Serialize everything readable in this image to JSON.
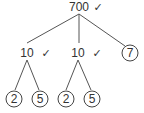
{
  "diagram": {
    "type": "factor-tree",
    "colors": {
      "stroke": "#555555",
      "text": "#333333",
      "background": "#ffffff"
    },
    "check_glyph": "✓",
    "nodes": {
      "root": {
        "value": "700",
        "checked": true
      },
      "left": {
        "value": "10",
        "checked": true
      },
      "middle": {
        "value": "10",
        "checked": true
      },
      "right": {
        "value": "7",
        "circled": true
      },
      "left_a": {
        "value": "2",
        "circled": true
      },
      "left_b": {
        "value": "5",
        "circled": true
      },
      "middle_a": {
        "value": "2",
        "circled": true
      },
      "middle_b": {
        "value": "5",
        "circled": true
      }
    },
    "edges": [
      [
        "root",
        "left"
      ],
      [
        "root",
        "middle"
      ],
      [
        "root",
        "right"
      ],
      [
        "left",
        "left_a"
      ],
      [
        "left",
        "left_b"
      ],
      [
        "middle",
        "middle_a"
      ],
      [
        "middle",
        "middle_b"
      ]
    ]
  }
}
